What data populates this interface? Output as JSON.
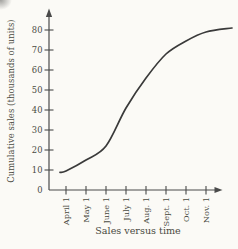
{
  "colors": {
    "background": "#fbfaf6",
    "curve": "#3a3a3a",
    "axis": "#4a4a4a",
    "text": "#4a4a42"
  },
  "chart_data": {
    "type": "line",
    "title": "Sales versus time",
    "xlabel": "",
    "ylabel": "Cumulative sales (thousands of units)",
    "x_tick_labels": [
      "April 1",
      "May 1",
      "June 1",
      "July 1",
      "Aug. 1",
      "Sept. 1",
      "Oct. 1",
      "Nov. 1"
    ],
    "y_ticks": [
      0,
      10,
      20,
      30,
      40,
      50,
      60,
      70,
      80
    ],
    "ylim": [
      0,
      88
    ],
    "grid": false,
    "legend": "none",
    "axis_arrows": true,
    "series": [
      {
        "name": "cumulative sales",
        "x_unit": "month index (0 = April 1)",
        "points": [
          [
            -0.3,
            8.8
          ],
          [
            0,
            9.5
          ],
          [
            1,
            15
          ],
          [
            2,
            22
          ],
          [
            3,
            41
          ],
          [
            4,
            56
          ],
          [
            5,
            68
          ],
          [
            6,
            74.5
          ],
          [
            7,
            79
          ],
          [
            8.3,
            81
          ]
        ]
      }
    ]
  }
}
